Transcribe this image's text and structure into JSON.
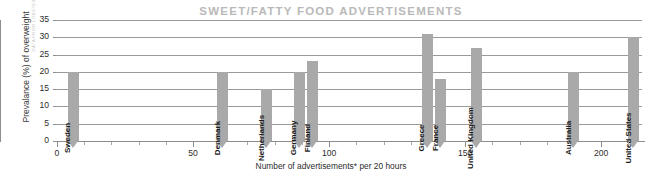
{
  "chart_data": {
    "type": "bar",
    "title": "SWEET/FATTY FOOD ADVERTISEMENTS",
    "xlabel": "Number of advertisements* per 20 hours",
    "ylabel": "Prevalance (%) of overweight",
    "xlim": [
      0,
      215
    ],
    "ylim": [
      0,
      35
    ],
    "xticks": [
      0,
      50,
      100,
      150,
      200
    ],
    "xtick_labels": [
      "0",
      "50",
      "100",
      "150",
      "200"
    ],
    "xtick_minor_step": 10,
    "yticks": [
      0,
      5,
      10,
      15,
      20,
      25,
      30,
      35
    ],
    "ytick_labels": [
      "0",
      "5",
      "10",
      "15",
      "20",
      "25",
      "30",
      "35"
    ],
    "grid": "horizontal",
    "legend": "none",
    "bar_color": "#a9a9a9",
    "categories": [
      "Sweden",
      "Denmark",
      "Netherlands",
      "Germany",
      "Finland",
      "Greece",
      "France",
      "United Kingdom",
      "Australia",
      "United States"
    ],
    "x": [
      6,
      61,
      77,
      89,
      94,
      136,
      141,
      154,
      190,
      212
    ],
    "values": [
      20,
      20,
      15,
      20,
      23,
      31,
      18,
      27,
      20,
      30
    ],
    "points": [
      {
        "label": "Sweden",
        "x": 6,
        "y": 20
      },
      {
        "label": "Denmark",
        "x": 61,
        "y": 20
      },
      {
        "label": "Netherlands",
        "x": 77,
        "y": 15
      },
      {
        "label": "Germany",
        "x": 89,
        "y": 20
      },
      {
        "label": "Finland",
        "x": 94,
        "y": 23
      },
      {
        "label": "Greece",
        "x": 136,
        "y": 31
      },
      {
        "label": "France",
        "x": 141,
        "y": 18
      },
      {
        "label": "United Kingdom",
        "x": 154,
        "y": 27
      },
      {
        "label": "Australia",
        "x": 190,
        "y": 20
      },
      {
        "label": "United States",
        "x": 212,
        "y": 30
      }
    ]
  },
  "source_credit": "DATA FROM LOBSTEIN AND DIBB, 2005"
}
